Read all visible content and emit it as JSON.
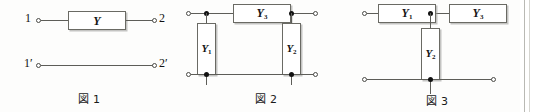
{
  "page": {
    "background_color": "#fdfdfc",
    "line_color": "#5d5d58",
    "node_color": "#111111"
  },
  "figures": [
    {
      "id": "figure-1",
      "caption": "図 1",
      "terminals": [
        {
          "name": "terminal-1",
          "label": "1"
        },
        {
          "name": "terminal-2",
          "label": "2"
        },
        {
          "name": "terminal-1p",
          "label": "1′"
        },
        {
          "name": "terminal-2p",
          "label": "2′"
        }
      ],
      "components": [
        {
          "name": "admittance-y",
          "label": "Y",
          "subscript": "",
          "orientation": "horizontal"
        }
      ]
    },
    {
      "id": "figure-2",
      "caption": "図 2",
      "terminals": [
        {
          "name": "terminal-top-left",
          "label": ""
        },
        {
          "name": "terminal-top-right",
          "label": ""
        },
        {
          "name": "terminal-bottom-left",
          "label": ""
        },
        {
          "name": "terminal-bottom-right",
          "label": ""
        }
      ],
      "components": [
        {
          "name": "admittance-y3",
          "label": "Y",
          "subscript": "3",
          "orientation": "horizontal"
        },
        {
          "name": "admittance-y1",
          "label": "Y",
          "subscript": "1",
          "orientation": "vertical"
        },
        {
          "name": "admittance-y2",
          "label": "Y",
          "subscript": "2",
          "orientation": "vertical"
        }
      ]
    },
    {
      "id": "figure-3",
      "caption": "図 3",
      "terminals": [
        {
          "name": "terminal-top-left",
          "label": ""
        },
        {
          "name": "terminal-top-right",
          "label": ""
        },
        {
          "name": "terminal-bottom-left",
          "label": ""
        },
        {
          "name": "terminal-bottom-right",
          "label": ""
        }
      ],
      "components": [
        {
          "name": "admittance-y1",
          "label": "Y",
          "subscript": "1",
          "orientation": "horizontal"
        },
        {
          "name": "admittance-y3",
          "label": "Y",
          "subscript": "3",
          "orientation": "horizontal"
        },
        {
          "name": "admittance-y2",
          "label": "Y",
          "subscript": "2",
          "orientation": "vertical"
        }
      ]
    }
  ]
}
